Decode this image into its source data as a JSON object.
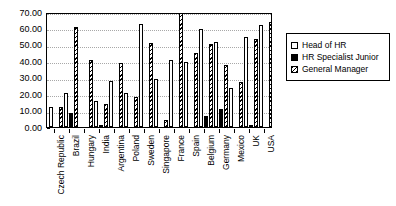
{
  "chart_data": {
    "type": "bar",
    "title": "",
    "subtitle": "",
    "xlabel": "",
    "ylabel": "",
    "ylim": [
      0,
      70
    ],
    "yticks": [
      "0.00",
      "10.00",
      "20.00",
      "30.00",
      "40.00",
      "50.00",
      "60.00",
      "70.00"
    ],
    "ytick_values": [
      0,
      10,
      20,
      30,
      40,
      50,
      60,
      70
    ],
    "grid": true,
    "legend_position": "right",
    "categories": [
      "Czech Republic",
      "Brazil",
      "Hungary",
      "India",
      "Argentina",
      "Poland",
      "Sweden",
      "Singapore",
      "France",
      "Spain",
      "Belgium",
      "Germany",
      "Mexico",
      "UK",
      "USA"
    ],
    "series": [
      {
        "name": "Head of HR",
        "fill": "open",
        "color": "#ffffff",
        "values": [
          12.0,
          21.0,
          0.0,
          16.0,
          28.0,
          21.0,
          62.5,
          29.0,
          41.0,
          39.5,
          59.5,
          51.5,
          23.5,
          55.0,
          62.0
        ]
      },
      {
        "name": "HR Specialist Junior",
        "fill": "solid",
        "color": "#000000",
        "values": [
          0.0,
          8.5,
          0.0,
          0.6,
          0.0,
          0.0,
          0.0,
          0.0,
          0.0,
          0.0,
          7.0,
          11.0,
          0.0,
          1.5,
          0.0
        ]
      },
      {
        "name": "General Manager",
        "fill": "hatched",
        "color": "#000000",
        "values": [
          12.0,
          61.0,
          40.5,
          14.0,
          39.0,
          18.5,
          51.0,
          4.0,
          72.0,
          45.0,
          50.5,
          37.5,
          27.5,
          53.5,
          64.0
        ]
      }
    ]
  },
  "legend": {
    "items": [
      {
        "label": "Head of HR",
        "swatch": "open-square-swatch"
      },
      {
        "label": "HR Specialist Junior",
        "swatch": "filled-square-swatch"
      },
      {
        "label": "General Manager",
        "swatch": "hatched-square-swatch"
      }
    ]
  }
}
